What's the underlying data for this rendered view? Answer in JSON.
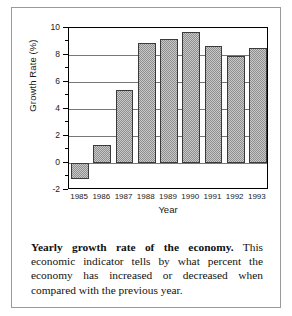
{
  "chart_data": {
    "type": "bar",
    "title": "",
    "xlabel": "Year",
    "ylabel": "Growth Rate (%)",
    "categories": [
      "1985",
      "1986",
      "1987",
      "1988",
      "1989",
      "1990",
      "1991",
      "1992",
      "1993"
    ],
    "values": [
      -1.2,
      1.3,
      5.4,
      8.9,
      9.2,
      9.7,
      8.7,
      7.9,
      8.5
    ],
    "ylim": [
      -2,
      10
    ],
    "ytick_labels": [
      "10",
      "8",
      "6",
      "4",
      "2",
      "0",
      "-2"
    ],
    "ytick_values": [
      10,
      8,
      6,
      4,
      2,
      0,
      -2
    ],
    "yminor_step": 1,
    "grid": "horizontal",
    "legend": "none",
    "bar_fill": "#c9c9c9",
    "bar_hatch": "dotted-halftone",
    "bar_edge": "#3a3a3a"
  },
  "caption": {
    "title": "Yearly growth rate of the economy.",
    "body": " This economic indicator tells by what percent the economy has increased or decreased when compared with the previous year."
  }
}
